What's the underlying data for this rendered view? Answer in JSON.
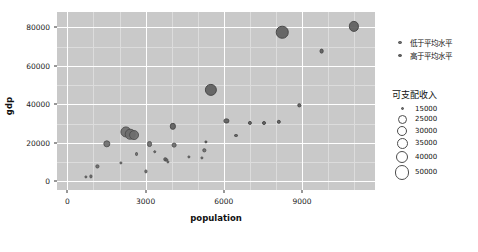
{
  "chart_data": {
    "type": "scatter",
    "title": "",
    "xlabel": "population",
    "ylabel": "gdp",
    "xlim": [
      -400,
      11800
    ],
    "ylim": [
      -4500,
      88000
    ],
    "xticks": [
      "0",
      "3000",
      "6000",
      "9000"
    ],
    "xtick_values": [
      0,
      3000,
      6000,
      9000
    ],
    "yticks": [
      "0",
      "20000",
      "40000",
      "60000",
      "80000"
    ],
    "ytick_values": [
      0,
      20000,
      40000,
      60000,
      80000
    ],
    "grid": true,
    "grid_color": "#ffffff",
    "panel_color": "#c9c9c9",
    "size_field": "可支配收入",
    "color_field": "",
    "legend_position": "right",
    "series": [
      {
        "name": "低于平均水平",
        "color": "#6e6e6e",
        "points": [
          {
            "x": 700,
            "y": 2400,
            "size": 16000
          },
          {
            "x": 900,
            "y": 2600,
            "size": 17000
          },
          {
            "x": 1150,
            "y": 7800,
            "size": 15500
          },
          {
            "x": 1500,
            "y": 19500,
            "size": 28000
          },
          {
            "x": 2050,
            "y": 9600,
            "size": 16000
          },
          {
            "x": 2250,
            "y": 25500,
            "size": 40000
          },
          {
            "x": 2400,
            "y": 24500,
            "size": 38000
          },
          {
            "x": 2550,
            "y": 24000,
            "size": 36000
          },
          {
            "x": 2650,
            "y": 14200,
            "size": 19000
          },
          {
            "x": 3000,
            "y": 5200,
            "size": 15500
          },
          {
            "x": 3150,
            "y": 19500,
            "size": 24000
          },
          {
            "x": 3350,
            "y": 15500,
            "size": 18000
          },
          {
            "x": 3750,
            "y": 11400,
            "size": 17500
          },
          {
            "x": 3800,
            "y": 11000,
            "size": 16500
          },
          {
            "x": 3850,
            "y": 10200,
            "size": 16000
          },
          {
            "x": 4100,
            "y": 18700,
            "size": 21000
          },
          {
            "x": 4650,
            "y": 12500,
            "size": 16000
          },
          {
            "x": 5150,
            "y": 12200,
            "size": 16500
          },
          {
            "x": 5250,
            "y": 16100,
            "size": 17500
          }
        ]
      },
      {
        "name": "高于平均水平",
        "color": "#5f5f5f",
        "points": [
          {
            "x": 4050,
            "y": 28500,
            "size": 25000
          },
          {
            "x": 5300,
            "y": 20700,
            "size": 17000
          },
          {
            "x": 5500,
            "y": 47500,
            "size": 44000
          },
          {
            "x": 6100,
            "y": 31200,
            "size": 22000
          },
          {
            "x": 6450,
            "y": 23800,
            "size": 19000
          },
          {
            "x": 7000,
            "y": 30400,
            "size": 19500
          },
          {
            "x": 7550,
            "y": 30500,
            "size": 19000
          },
          {
            "x": 8100,
            "y": 31000,
            "size": 20000
          },
          {
            "x": 8250,
            "y": 77500,
            "size": 45000
          },
          {
            "x": 8900,
            "y": 39500,
            "size": 17500
          },
          {
            "x": 9750,
            "y": 67500,
            "size": 21000
          },
          {
            "x": 11000,
            "y": 80500,
            "size": 37000
          }
        ]
      }
    ],
    "size_legend": {
      "title": "可支配收入",
      "entries": [
        {
          "label": "15000",
          "diameter": 3
        },
        {
          "label": "25000",
          "diameter": 9
        },
        {
          "label": "30000",
          "diameter": 10
        },
        {
          "label": "35000",
          "diameter": 11
        },
        {
          "label": "40000",
          "diameter": 12.5
        },
        {
          "label": "50000",
          "diameter": 14.5
        }
      ]
    }
  }
}
